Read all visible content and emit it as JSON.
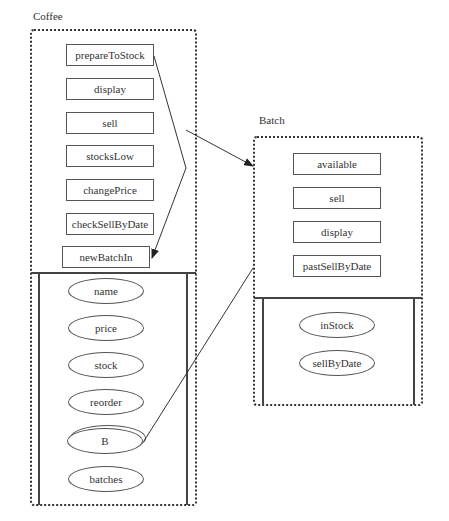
{
  "coffee": {
    "title": "Coffee",
    "methods": [
      "prepareToStock",
      "display",
      "sell",
      "stocksLow",
      "changePrice",
      "checkSellByDate",
      "newBatchIn"
    ],
    "attributes": [
      "name",
      "price",
      "stock",
      "reorder",
      "B",
      "batches"
    ]
  },
  "batch": {
    "title": "Batch",
    "methods": [
      "available",
      "sell",
      "display",
      "pastSellByDate"
    ],
    "attributes": [
      "inStock",
      "sellByDate"
    ]
  },
  "connections": [
    {
      "from": "coffee.sell",
      "to": "batch",
      "type": "arrow"
    },
    {
      "from": "coffee.prepareToStock",
      "to": "coffee.newBatchIn",
      "type": "arrow"
    },
    {
      "from": "coffee.B",
      "to": "batch",
      "type": "line"
    }
  ]
}
